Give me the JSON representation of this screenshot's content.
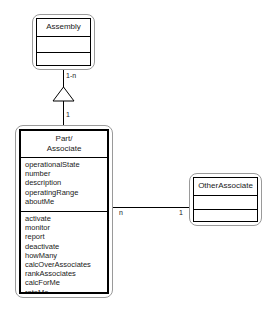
{
  "diagram": {
    "type": "uml-class-diagram",
    "background_color": "#ffffff",
    "line_color": "#000000",
    "outer_border_color": "#9a9a9a"
  },
  "classes": {
    "assembly": {
      "name": "Assembly",
      "attributes": [],
      "operations": []
    },
    "part_associate": {
      "name": "Part/\nAssociate",
      "name_line1": "Part/",
      "name_line2": "Associate",
      "attributes": [
        "operationalState",
        "number",
        "description",
        "operatingRange",
        "aboutMe"
      ],
      "operations": [
        "activate",
        "monitor",
        "report",
        "deactivate",
        "howMany",
        "calcOverAssociates",
        "rankAssociates",
        "calcForMe",
        "rateMe"
      ]
    },
    "other_associate": {
      "name": "OtherAssociate",
      "attributes": [],
      "operations": []
    }
  },
  "relationships": {
    "generalization": {
      "kind": "generalization-hollow-triangle",
      "from": "Part/Associate",
      "to": "Assembly",
      "multiplicity_at_assembly": "1-n",
      "multiplicity_at_part": "1"
    },
    "association": {
      "kind": "association-plain-line",
      "from": "Part/Associate",
      "to": "OtherAssociate",
      "multiplicity_at_part": "n",
      "multiplicity_at_other": "1"
    }
  }
}
